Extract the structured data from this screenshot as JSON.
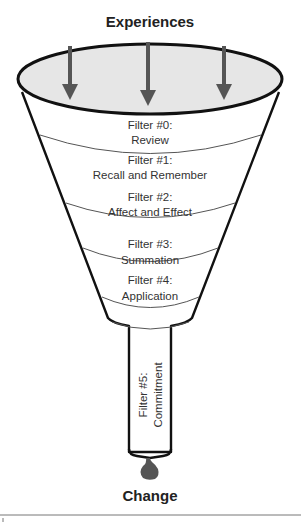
{
  "diagram": {
    "top_label": "Experiences",
    "bottom_label": "Change",
    "colors": {
      "outline": "#111111",
      "rim_fill": "#e6e6e6",
      "arrow": "#555555",
      "drop": "#555555",
      "band_line": "#555555"
    },
    "filters": [
      {
        "line1": "Filter #0:",
        "line2": "Review"
      },
      {
        "line1": "Filter #1:",
        "line2": "Recall and Remember"
      },
      {
        "line1": "Filter #2:",
        "line2": "Affect and Effect"
      },
      {
        "line1": "Filter #3:",
        "line2": "Summation"
      },
      {
        "line1": "Filter #4:",
        "line2": "Application"
      }
    ],
    "tube_filter": {
      "line1": "Filter #5:",
      "line2": "Commitment"
    }
  }
}
